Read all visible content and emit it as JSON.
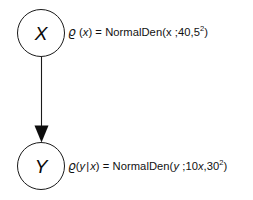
{
  "diagram": {
    "type": "bayesian-network",
    "title": "",
    "background_color": "#ffffff",
    "stroke_color": "#1a1a1a",
    "text_color": "#111111",
    "nodes": [
      {
        "id": "X",
        "label": "X",
        "shape": "circle",
        "position": {
          "x": 17,
          "y": 9,
          "w": 48,
          "h": 48
        }
      },
      {
        "id": "Y",
        "label": "Y",
        "shape": "circle",
        "position": {
          "x": 17,
          "y": 142,
          "w": 48,
          "h": 48
        }
      }
    ],
    "edges": [
      {
        "from": "X",
        "to": "Y",
        "style": "solid",
        "arrowhead": "filled-triangle",
        "direction": "down"
      }
    ],
    "annotations": [
      {
        "id": "formula-x",
        "attached_to": "X",
        "rho_symbol": "ϱ",
        "lhs_arg": "(x)",
        "equals": "=",
        "function_name": "NormalDen",
        "open_paren": "(",
        "variable": "x",
        "separator": " ;",
        "mean": "40",
        "comma": ",",
        "sd": "5",
        "sd_exponent": "2",
        "close_paren": ")",
        "full_text": "ϱ (x) = NormalDen(x ;40,5²)"
      },
      {
        "id": "formula-y",
        "attached_to": "Y",
        "rho_symbol": "ϱ",
        "lhs_arg": "(y | x)",
        "lhs_var": "y",
        "lhs_bar": "|",
        "lhs_cond": "x",
        "equals": "=",
        "function_name": "NormalDen",
        "open_paren": "(",
        "variable": "y",
        "separator": " ;",
        "mean": "10x",
        "mean_coef": "10",
        "mean_var": "x",
        "comma": ",",
        "sd": "30",
        "sd_exponent": "2",
        "close_paren": ")",
        "full_text": "ϱ (y | x) = NormalDen(y ;10x,30²)"
      }
    ]
  }
}
